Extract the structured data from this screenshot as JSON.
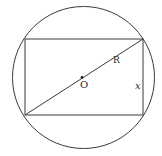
{
  "diagram": {
    "type": "geometry",
    "colors": {
      "stroke": "#3a3a3a",
      "background": "#ffffff"
    },
    "circle": {
      "cx": 83.5,
      "cy": 77.5,
      "r": 71
    },
    "rectangle": {
      "x": 25,
      "y": 39,
      "width": 118,
      "height": 76
    },
    "diagonal": {
      "x1": 25,
      "y1": 115,
      "x2": 143,
      "y2": 39
    },
    "center_point": {
      "cx": 82,
      "cy": 77.5,
      "r": 1.4
    },
    "labels": {
      "center": "O",
      "radius": "R",
      "side": "x"
    }
  }
}
